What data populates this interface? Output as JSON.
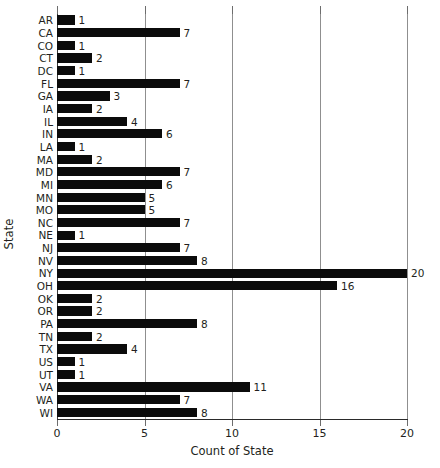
{
  "chart_data": {
    "type": "bar",
    "orientation": "horizontal",
    "title": "",
    "xlabel": "Count of State",
    "ylabel": "State",
    "xlim": [
      0,
      20
    ],
    "xticks": [
      0,
      5,
      10,
      15,
      20
    ],
    "xtick_labels": [
      "0",
      "5",
      "10",
      "15",
      "20"
    ],
    "grid": true,
    "grid_axis": "x",
    "legend": false,
    "bar_color": "#0b0b0b",
    "gridline_color": "#8f8f8f",
    "axis_color": "#2a2a2a",
    "text_color": "#231f20",
    "background": "#ffffff",
    "show_value_labels": true,
    "categories": [
      "AR",
      "CA",
      "CO",
      "CT",
      "DC",
      "FL",
      "GA",
      "IA",
      "IL",
      "IN",
      "LA",
      "MA",
      "MD",
      "MI",
      "MN",
      "MO",
      "NC",
      "NE",
      "NJ",
      "NV",
      "NY",
      "OH",
      "OK",
      "OR",
      "PA",
      "TN",
      "TX",
      "US",
      "UT",
      "VA",
      "WA",
      "WI"
    ],
    "values": [
      1,
      7,
      1,
      2,
      1,
      7,
      3,
      2,
      4,
      6,
      1,
      2,
      7,
      6,
      5,
      5,
      7,
      1,
      7,
      8,
      20,
      16,
      2,
      2,
      8,
      2,
      4,
      1,
      1,
      11,
      7,
      8
    ],
    "value_labels": [
      "1",
      "7",
      "1",
      "2",
      "1",
      "7",
      "3",
      "2",
      "4",
      "6",
      "1",
      "2",
      "7",
      "6",
      "5",
      "5",
      "7",
      "1",
      "7",
      "8",
      "20",
      "16",
      "2",
      "2",
      "8",
      "2",
      "4",
      "1",
      "1",
      "11",
      "7",
      "8"
    ]
  }
}
